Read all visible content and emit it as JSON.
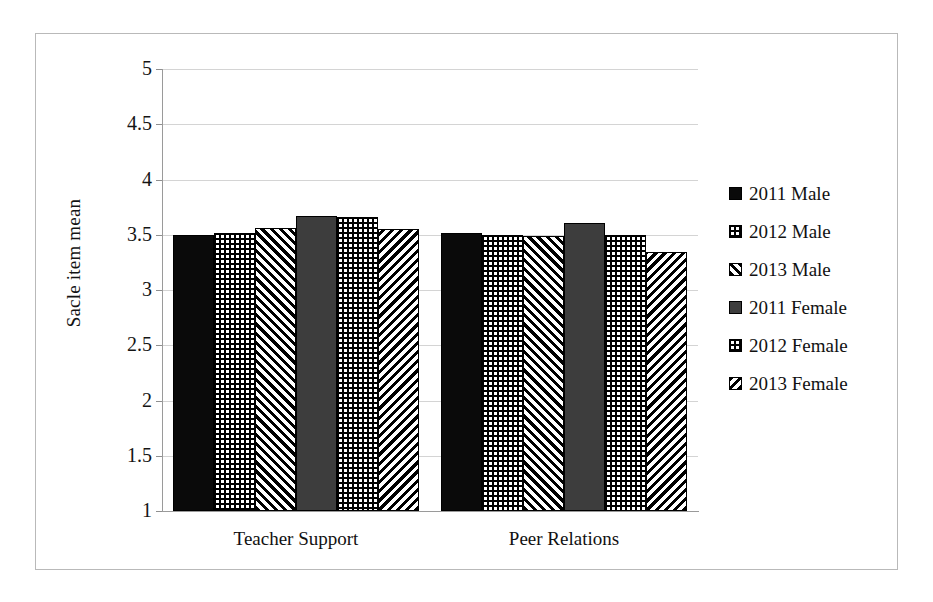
{
  "chart_data": {
    "type": "bar",
    "title": "",
    "subtitle": "",
    "xlabel": "",
    "ylabel": "Sacle item mean",
    "ylim": [
      1,
      5
    ],
    "ytick_labels": [
      "5",
      "4.5",
      "4",
      "3.5",
      "3",
      "2.5",
      "2",
      "1.5",
      "1"
    ],
    "ytick_values": [
      5,
      4.5,
      4,
      3.5,
      3,
      2.5,
      2,
      1.5,
      1
    ],
    "grid": true,
    "legend_position": "right",
    "categories": [
      "Teacher Support",
      "Peer Relations"
    ],
    "series": [
      {
        "name": "2011 Male",
        "values": [
          3.5,
          3.52
        ],
        "pattern": "solid-black",
        "swatch": "pat-solid-black"
      },
      {
        "name": "2012 Male",
        "values": [
          3.52,
          3.5
        ],
        "pattern": "dots",
        "swatch": "pat-dots"
      },
      {
        "name": "2013 Male",
        "values": [
          3.56,
          3.49
        ],
        "pattern": "diag-forward",
        "swatch": "pat-diag-fwd"
      },
      {
        "name": "2011 Female",
        "values": [
          3.67,
          3.61
        ],
        "pattern": "solid-gray",
        "swatch": "pat-solid-gray"
      },
      {
        "name": "2012 Female",
        "values": [
          3.66,
          3.5
        ],
        "pattern": "dots",
        "swatch": "pat-dots"
      },
      {
        "name": "2013 Female",
        "values": [
          3.55,
          3.34
        ],
        "pattern": "diag-back",
        "swatch": "pat-diag-back"
      }
    ],
    "colors": {
      "solid_black": "#0a0a0a",
      "solid_gray": "#3d3d3d",
      "gridline": "#d4d4d4",
      "axis": "#9a9a9a",
      "text": "#111111",
      "frame": "#b9b9b9"
    }
  },
  "legend": {
    "entries": [
      {
        "label": "2011 Male"
      },
      {
        "label": "2012 Male"
      },
      {
        "label": "2013 Male"
      },
      {
        "label": "2011 Female"
      },
      {
        "label": "2012 Female"
      },
      {
        "label": "2013 Female"
      }
    ]
  }
}
